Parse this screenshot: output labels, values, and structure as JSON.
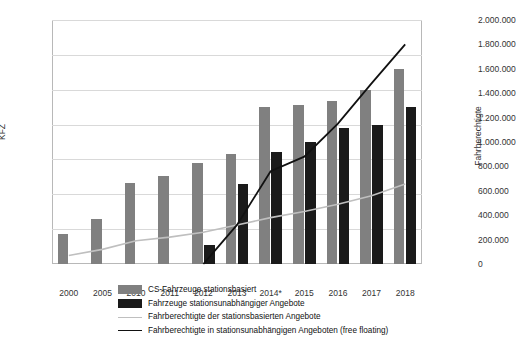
{
  "chart_data": {
    "type": "bar",
    "title": "",
    "xlabel": "",
    "ylabel": "KFZ",
    "ylabel_right": "Fahrberechtigte",
    "grid": true,
    "legend_position": "bottom",
    "categories": [
      "2000",
      "2005",
      "2010",
      "2011",
      "2012",
      "2013",
      "2014*",
      "2015",
      "2016",
      "2017",
      "2018"
    ],
    "ylim": [
      0,
      14000
    ],
    "yticks": [
      "0",
      "2.000",
      "4.000",
      "6.000",
      "8.000",
      "10.000",
      "12.000",
      "14.000"
    ],
    "y2lim": [
      0,
      2000000
    ],
    "y2ticks": [
      "0",
      "200.000",
      "400.000",
      "600.000",
      "800.000",
      "1.000.000",
      "1.200.000",
      "1.400.000",
      "1.600.000",
      "1.800.000",
      "2.000.000"
    ],
    "series": [
      {
        "name": "CS-Fahrzeuge stationsbasiert",
        "kind": "bar",
        "axis": "left",
        "color": "#808080",
        "values": [
          1700,
          2600,
          4650,
          5050,
          5800,
          6300,
          9000,
          9100,
          9350,
          10000,
          11200
        ]
      },
      {
        "name": "Fahrzeuge stationsunabhängiger Angebote",
        "kind": "bar",
        "axis": "left",
        "color": "#1a1a1a",
        "values": [
          null,
          null,
          null,
          null,
          1100,
          4600,
          6400,
          7000,
          7800,
          7950,
          9000
        ]
      },
      {
        "name": "Fahrberechtigte der stationsbasierten Angebote",
        "kind": "line",
        "axis": "right",
        "color": "#bfbfbf",
        "values": [
          70000,
          120000,
          190000,
          220000,
          260000,
          320000,
          380000,
          430000,
          490000,
          560000,
          655000
        ]
      },
      {
        "name": "Fahrberechtigte in stationsunabhängigen Angeboten (free floating)",
        "kind": "line",
        "axis": "right",
        "color": "#111111",
        "values": [
          null,
          null,
          null,
          null,
          0,
          320000,
          760000,
          880000,
          1150000,
          1480000,
          1800000
        ]
      }
    ]
  }
}
